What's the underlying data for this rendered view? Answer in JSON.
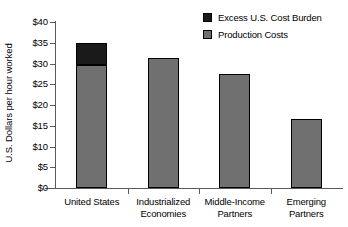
{
  "chart_data": {
    "type": "bar",
    "subtype": "stacked-vertical",
    "title": "",
    "xlabel": "",
    "ylabel": "U.S. Dollars per hour worked",
    "ylim": [
      0,
      40
    ],
    "yticks": [
      "$0",
      "$5",
      "$10",
      "$15",
      "$20",
      "$25",
      "$30",
      "$35",
      "$40"
    ],
    "ytick_values": [
      0,
      5,
      10,
      15,
      20,
      25,
      30,
      35,
      40
    ],
    "grid": false,
    "legend_position": "top-right",
    "categories": [
      "United States",
      "Industrialized Economies",
      "Middle-Income Partners",
      "Emerging Partners"
    ],
    "category_lines": [
      [
        "United States"
      ],
      [
        "Industrialized",
        "Economies"
      ],
      [
        "Middle-Income",
        "Partners"
      ],
      [
        "Emerging",
        "Partners"
      ]
    ],
    "series": [
      {
        "name": "Production Costs",
        "color": "#707070",
        "values": [
          29.7,
          31.4,
          27.5,
          16.6
        ]
      },
      {
        "name": "Excess U.S. Cost Burden",
        "color": "#1a1a1a",
        "values": [
          5.3,
          0,
          0,
          0
        ]
      }
    ],
    "totals": [
      35.0,
      31.4,
      27.5,
      16.6
    ]
  },
  "legend": {
    "items": [
      {
        "label": "Excess U.S. Cost Burden",
        "color": "#1a1a1a"
      },
      {
        "label": "Production Costs",
        "color": "#707070"
      }
    ]
  },
  "axis": {
    "y_title": "U.S. Dollars per hour worked"
  },
  "colors": {
    "production": "#707070",
    "excess": "#1a1a1a",
    "axis": "#5a5a5a",
    "outline": "#000000",
    "background": "#ffffff"
  }
}
